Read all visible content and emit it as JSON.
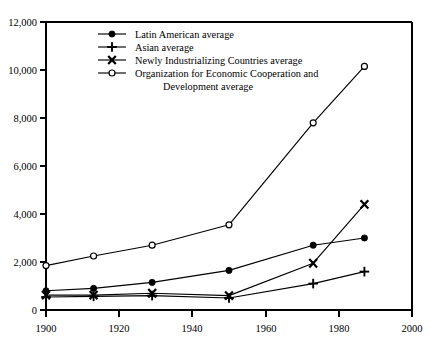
{
  "chart_data": {
    "type": "line",
    "title": "",
    "subtitle": "",
    "xlabel": "",
    "ylabel": "",
    "xlim": [
      1900,
      2000
    ],
    "ylim": [
      0,
      12000
    ],
    "xticks": [
      1900,
      1920,
      1940,
      1960,
      1980,
      2000
    ],
    "xticklabels": [
      "1900",
      "1920",
      "1940",
      "1960",
      "1980",
      "2000"
    ],
    "yticks": [
      0,
      2000,
      4000,
      6000,
      8000,
      10000,
      12000
    ],
    "yticklabels": [
      "0",
      "2,000",
      "4,000",
      "6,000",
      "8,000",
      "10,000",
      "12,000"
    ],
    "grid": false,
    "legend_position": "upper-left-inside",
    "x": [
      1900,
      1913,
      1929,
      1950,
      1973,
      1987
    ],
    "series": [
      {
        "name": "Latin American average",
        "marker": "filled-circle",
        "values": [
          800,
          900,
          1150,
          1650,
          2700,
          3000
        ]
      },
      {
        "name": "Asian average",
        "marker": "plus",
        "values": [
          540,
          570,
          600,
          500,
          1100,
          1600
        ]
      },
      {
        "name": "Newly Industrializing Countries average",
        "marker": "ex",
        "values": [
          620,
          620,
          700,
          600,
          1950,
          4400
        ]
      },
      {
        "name": "Organization for Economic Cooperation and Development average",
        "marker": "open-circle",
        "values": [
          1850,
          2250,
          2700,
          3550,
          7800,
          10150
        ]
      }
    ]
  },
  "legend": {
    "entries": [
      {
        "label": "Latin American average",
        "label2": "",
        "marker": "filled-circle"
      },
      {
        "label": "Asian average",
        "label2": "",
        "marker": "plus"
      },
      {
        "label": "Newly Industrializing Countries average",
        "label2": "",
        "marker": "ex"
      },
      {
        "label": "Organization for Economic Cooperation and",
        "label2": "Development average",
        "marker": "open-circle"
      }
    ]
  },
  "axes": {
    "y_labels": [
      "12,000",
      "10,000",
      "8,000",
      "6,000",
      "4,000",
      "2,000",
      "0"
    ],
    "x_labels": [
      "1900",
      "1920",
      "1940",
      "1960",
      "1980",
      "2000"
    ]
  },
  "colors": {
    "ink": "#000000",
    "background": "#ffffff"
  }
}
